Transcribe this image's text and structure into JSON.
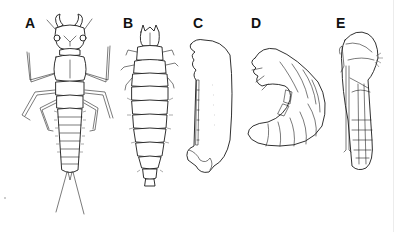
{
  "figure": {
    "type": "scientific line-drawing plate",
    "background": "#ffffff",
    "ink_color": "#1a1a1a",
    "panels": [
      {
        "label": "A",
        "subject": "campodeiform larva (dorsal view, six legs, two long cerci)"
      },
      {
        "label": "B",
        "subject": "elateriform/carabiform larva (dorsal view, segmented body, short legs)"
      },
      {
        "label": "C",
        "subject": "eruciform-like larva (lateral view, elongate body)"
      },
      {
        "label": "D",
        "subject": "scarabaeiform larva (C-shaped grub, lateral view)"
      },
      {
        "label": "E",
        "subject": "exarate pupa (lateral view, appendages free)"
      }
    ]
  }
}
